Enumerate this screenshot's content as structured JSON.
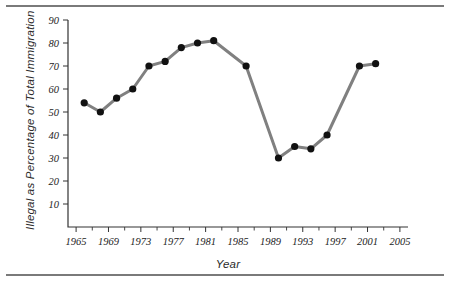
{
  "figure": {
    "background_color": "#ffffff",
    "rule_color": "#7a7a7a",
    "top_rule_name": "top-divider",
    "bottom_rule_name": "bottom-divider"
  },
  "chart_data": {
    "type": "line",
    "title": "",
    "subtitle": "",
    "xlabel": "Year",
    "ylabel": "Illegal as Percentage of Total Immigration",
    "xlim": [
      1964,
      2006
    ],
    "ylim": [
      0,
      90
    ],
    "grid": false,
    "legend": "none",
    "line_color": "#808080",
    "marker_color": "#111111",
    "line_width": 3,
    "marker_radius": 3.6,
    "x_tick_labels": [
      "1965",
      "1969",
      "1973",
      "1977",
      "1981",
      "1985",
      "1989",
      "1993",
      "1997",
      "2001",
      "2005"
    ],
    "x_tick_values": [
      1965,
      1969,
      1973,
      1977,
      1981,
      1985,
      1989,
      1993,
      1997,
      2001,
      2005
    ],
    "x_minor_tick_values": [
      1967,
      1971,
      1975,
      1979,
      1983,
      1987,
      1991,
      1995,
      1999,
      2003
    ],
    "y_tick_labels": [
      "10",
      "20",
      "30",
      "40",
      "50",
      "60",
      "70",
      "80",
      "90"
    ],
    "y_tick_values": [
      10,
      20,
      30,
      40,
      50,
      60,
      70,
      80,
      90
    ],
    "x": [
      1966,
      1968,
      1970,
      1972,
      1974,
      1976,
      1978,
      1980,
      1982,
      1986,
      1990,
      1992,
      1994,
      1996,
      2000,
      2002
    ],
    "values": [
      54,
      50,
      56,
      60,
      70,
      72,
      78,
      80,
      81,
      70,
      30,
      35,
      34,
      40,
      70,
      71
    ],
    "series": [
      {
        "name": "Illegal as Percentage of Total Immigration",
        "values": [
          54,
          50,
          56,
          60,
          70,
          72,
          78,
          80,
          81,
          70,
          30,
          35,
          34,
          40,
          70,
          71
        ]
      }
    ]
  }
}
